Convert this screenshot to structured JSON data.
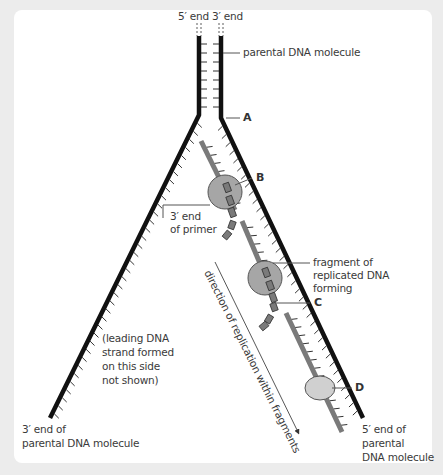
{
  "diagram": {
    "labels": {
      "top_left_end": "5′ end",
      "top_right_end": "3′ end",
      "parental": "parental DNA molecule",
      "A": "A",
      "B": "B",
      "C": "C",
      "D": "D",
      "primer_line1": "3′ end",
      "primer_line2": "of primer",
      "fragment_line1": "fragment of",
      "fragment_line2": "replicated DNA",
      "fragment_line3": "forming",
      "leading_line1": "(leading DNA",
      "leading_line2": "strand formed",
      "leading_line3": "on this side",
      "leading_line4": "not shown)",
      "direction": "direction of replication within fragments",
      "bl_line1": "3′ end of",
      "bl_line2": "parental DNA molecule",
      "br_line1": "5′ end of",
      "br_line2": "parental",
      "br_line3": "DNA molecule"
    },
    "colors": {
      "strand": "#111111",
      "fragment": "#7a7a7a",
      "enzyme_dark": "#a6a6a6",
      "enzyme_light": "#d0d0d0",
      "leader_line": "#555555",
      "background": "#ececec",
      "panel": "#ffffff"
    }
  }
}
